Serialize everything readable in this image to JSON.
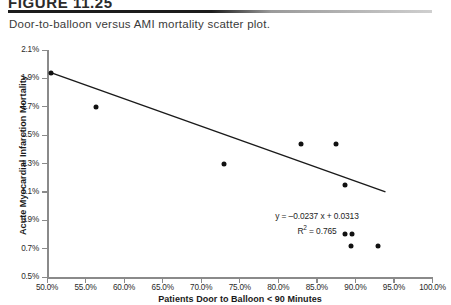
{
  "figure": {
    "label": "FIGURE 11.25",
    "caption": "Door-to-balloon versus AMI mortality scatter plot."
  },
  "annotation": {
    "equation": "y = –0.0237  x + 0.0313",
    "r_squared_prefix": "R",
    "r_squared_exp": "2",
    "r_squared_value": " = 0.765"
  },
  "chart_data": {
    "type": "scatter",
    "title": "Door-to-balloon versus AMI mortality scatter plot.",
    "xlabel": "Patients Door to Balloon < 90 Minutes",
    "ylabel": "Acute Myocardial Infarction Mortality",
    "xlim": [
      50.0,
      100.0
    ],
    "ylim": [
      0.5,
      2.1
    ],
    "xticks": [
      "50.0%",
      "55.0%",
      "60.0%",
      "65.0%",
      "70.0%",
      "75.0%",
      "80.0%",
      "85.0%",
      "90.0%",
      "95.0%",
      "100.0%"
    ],
    "yticks": [
      "2.1%",
      "1.9%",
      "1.7%",
      "1.5%",
      "1.3%",
      "1.1%",
      "0.9%",
      "0.7%",
      "0.5%"
    ],
    "xtick_values": [
      50,
      55,
      60,
      65,
      70,
      75,
      80,
      85,
      90,
      95,
      100
    ],
    "ytick_values": [
      2.1,
      1.9,
      1.7,
      1.5,
      1.3,
      1.1,
      0.9,
      0.7,
      0.5
    ],
    "grid": false,
    "legend": null,
    "points": [
      {
        "x": 50.5,
        "y": 1.94
      },
      {
        "x": 56.4,
        "y": 1.7
      },
      {
        "x": 73.0,
        "y": 1.3
      },
      {
        "x": 82.9,
        "y": 1.44
      },
      {
        "x": 87.5,
        "y": 1.44
      },
      {
        "x": 88.7,
        "y": 1.15
      },
      {
        "x": 88.7,
        "y": 0.8
      },
      {
        "x": 89.6,
        "y": 0.8
      },
      {
        "x": 89.4,
        "y": 0.72
      },
      {
        "x": 92.9,
        "y": 0.72
      }
    ],
    "trendline": {
      "equation": "y = -0.0237x + 0.0313",
      "slope": -0.0237,
      "intercept": 0.0313,
      "r_squared": 0.765,
      "x_start": 50.5,
      "x_end": 93.9,
      "y_start": 1.94,
      "y_end": 1.1
    }
  }
}
